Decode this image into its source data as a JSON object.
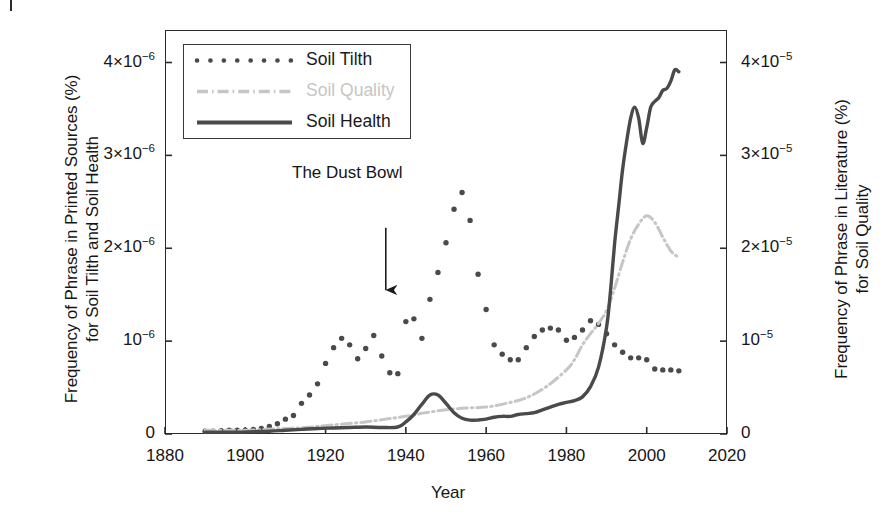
{
  "figure": {
    "panel_marker": "|",
    "background": "#ffffff"
  },
  "axes": {
    "x_title": "Year",
    "y_left_title_line1": "Frequency of Phrase in Printed Sources (%)",
    "y_left_title_line2": "for Soil Tilth and Soil Health",
    "y_right_title_line1": "Frequency of Phrase in Literature (%)",
    "y_right_title_line2": "for Soil Quality",
    "x_ticks": [
      "1880",
      "1900",
      "1920",
      "1940",
      "1960",
      "1980",
      "2000",
      "2020"
    ],
    "y_left_ticks": [
      "0",
      "10",
      "2×10",
      "3×10",
      "4×10"
    ],
    "y_left_exponents": [
      "",
      "−6",
      "−6",
      "−6",
      "−6"
    ],
    "y_right_ticks": [
      "0",
      "10",
      "2×10",
      "3×10",
      "4×10"
    ],
    "y_right_exponents": [
      "",
      "−5",
      "−5",
      "−5",
      "−5"
    ]
  },
  "legend": {
    "items": [
      {
        "label": "Soil Tilth",
        "style": "dotted",
        "color": "#4a4a4a"
      },
      {
        "label": "Soil Quality",
        "style": "dashdot",
        "color": "#c6c6c6"
      },
      {
        "label": "Soil Health",
        "style": "solid",
        "color": "#4a4a4a"
      }
    ]
  },
  "annotations": [
    {
      "text": "The Dust Bowl",
      "x_year": 1935,
      "arrow_from_value": 2.22e-06,
      "arrow_to_value": 1.55e-06
    }
  ],
  "chart_data": {
    "type": "line",
    "title": "",
    "xlabel": "Year",
    "ylabel": "Frequency of Phrase in Printed Sources (%) for Soil Tilth and Soil Health",
    "ylabel_right": "Frequency of Phrase in Literature (%) for Soil Quality",
    "xlim": [
      1880,
      2020
    ],
    "ylim_left": [
      0,
      4.35e-06
    ],
    "ylim_right": [
      0,
      4.35e-05
    ],
    "grid": false,
    "legend_position": "upper left",
    "series": [
      {
        "name": "Soil Tilth",
        "axis": "left",
        "style": "dotted",
        "color": "#4a4a4a",
        "x": [
          1890,
          1892,
          1894,
          1896,
          1898,
          1900,
          1902,
          1904,
          1906,
          1908,
          1910,
          1912,
          1914,
          1916,
          1918,
          1920,
          1922,
          1924,
          1926,
          1928,
          1930,
          1932,
          1934,
          1936,
          1938,
          1940,
          1942,
          1944,
          1946,
          1948,
          1950,
          1952,
          1954,
          1956,
          1958,
          1960,
          1962,
          1964,
          1966,
          1968,
          1970,
          1972,
          1974,
          1976,
          1978,
          1980,
          1982,
          1984,
          1986,
          1988,
          1990,
          1992,
          1994,
          1996,
          1998,
          2000,
          2002,
          2004,
          2006,
          2008
        ],
        "y": [
          3e-08,
          3e-08,
          3.5e-08,
          4e-08,
          4e-08,
          4e-08,
          5e-08,
          6e-08,
          8e-08,
          1.1e-07,
          1.6e-07,
          2e-07,
          3.3e-07,
          4.2e-07,
          5.4e-07,
          7.6e-07,
          9.3e-07,
          1.03e-06,
          9.6e-07,
          8.1e-07,
          9.2e-07,
          1.06e-06,
          8.4e-07,
          6.6e-07,
          6.5e-07,
          1.21e-06,
          1.24e-06,
          1.03e-06,
          1.45e-06,
          1.74e-06,
          2.06e-06,
          2.42e-06,
          2.6e-06,
          2.3e-06,
          1.72e-06,
          1.34e-06,
          9.6e-07,
          8.6e-07,
          8e-07,
          8e-07,
          9.3e-07,
          1.05e-06,
          1.12e-06,
          1.14e-06,
          1.12e-06,
          1.01e-06,
          1.04e-06,
          1.12e-06,
          1.22e-06,
          1.18e-06,
          1.08e-06,
          9.6e-07,
          8.8e-07,
          8.2e-07,
          8.2e-07,
          8e-07,
          7e-07,
          6.9e-07,
          6.9e-07,
          6.8e-07
        ]
      },
      {
        "name": "Soil Quality",
        "axis": "right",
        "style": "dashdot",
        "color": "#c6c6c6",
        "x": [
          1890,
          1895,
          1900,
          1905,
          1910,
          1915,
          1920,
          1925,
          1930,
          1935,
          1940,
          1945,
          1950,
          1955,
          1960,
          1965,
          1970,
          1975,
          1980,
          1982,
          1984,
          1986,
          1988,
          1990,
          1992,
          1994,
          1996,
          1998,
          2000,
          2002,
          2004,
          2006,
          2008
        ],
        "y": [
          4e-07,
          4e-07,
          4e-07,
          5e-07,
          6e-07,
          7e-07,
          9e-07,
          1.1e-06,
          1.3e-06,
          1.6e-06,
          1.9e-06,
          2.3e-06,
          2.6e-06,
          2.8e-06,
          2.9e-06,
          3.3e-06,
          3.9e-06,
          5.1e-06,
          6.9e-06,
          8e-06,
          9.6e-06,
          1.08e-05,
          1.19e-05,
          1.33e-05,
          1.57e-05,
          1.85e-05,
          2.1e-05,
          2.26e-05,
          2.35e-05,
          2.28e-05,
          2.12e-05,
          1.97e-05,
          1.9e-05
        ]
      },
      {
        "name": "Soil Health",
        "axis": "left",
        "style": "solid",
        "color": "#4a4a4a",
        "x": [
          1890,
          1894,
          1898,
          1902,
          1906,
          1910,
          1914,
          1918,
          1922,
          1926,
          1930,
          1934,
          1938,
          1940,
          1942,
          1944,
          1946,
          1948,
          1950,
          1952,
          1954,
          1956,
          1958,
          1960,
          1962,
          1964,
          1966,
          1968,
          1970,
          1972,
          1974,
          1976,
          1978,
          1980,
          1982,
          1984,
          1986,
          1988,
          1990,
          1991,
          1992,
          1993,
          1994,
          1995,
          1996,
          1997,
          1998,
          1999,
          2000,
          2001,
          2002,
          2003,
          2004,
          2005,
          2006,
          2007,
          2008
        ],
        "y": [
          2e-08,
          2e-08,
          2e-08,
          2.5e-08,
          3e-08,
          4e-08,
          5e-08,
          6e-08,
          6.5e-08,
          7e-08,
          7.5e-08,
          7e-08,
          7.5e-08,
          1.3e-07,
          2.1e-07,
          3.2e-07,
          4.2e-07,
          4.2e-07,
          3.3e-07,
          2.3e-07,
          1.7e-07,
          1.5e-07,
          1.5e-07,
          1.6e-07,
          1.8e-07,
          1.9e-07,
          1.9e-07,
          2.1e-07,
          2.2e-07,
          2.3e-07,
          2.6e-07,
          2.9e-07,
          3.2e-07,
          3.4e-07,
          3.6e-07,
          4e-07,
          5.1e-07,
          7.2e-07,
          1.15e-06,
          1.55e-06,
          2.05e-06,
          2.45e-06,
          2.85e-06,
          3.15e-06,
          3.4e-06,
          3.52e-06,
          3.4e-06,
          3.13e-06,
          3.3e-06,
          3.52e-06,
          3.58e-06,
          3.62e-06,
          3.7e-06,
          3.72e-06,
          3.8e-06,
          3.92e-06,
          3.9e-06
        ]
      }
    ]
  }
}
